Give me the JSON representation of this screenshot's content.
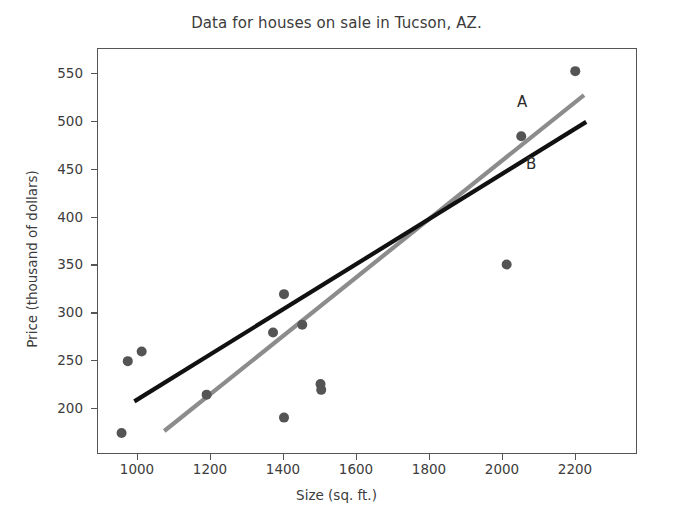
{
  "chart_data": {
    "type": "scatter",
    "title": "Data for houses on sale in Tucson, AZ.",
    "xlabel": "Size (sq. ft.)",
    "ylabel": "Price (thousand of dollars)",
    "xlim": [
      890,
      2270
    ],
    "ylim": [
      165,
      575
    ],
    "xticks": [
      1000,
      1200,
      1400,
      1600,
      1800,
      2000,
      2200
    ],
    "yticks": [
      200,
      250,
      300,
      350,
      400,
      450,
      500,
      550
    ],
    "xtick_labels": [
      "1000",
      "1200",
      "1400",
      "1600",
      "1800",
      "2000",
      "2200"
    ],
    "ytick_labels": [
      "200",
      "250",
      "300",
      "350",
      "400",
      "450",
      "500",
      "550"
    ],
    "grid": false,
    "legend": "none",
    "point_color": "#545454",
    "points": [
      {
        "x": 955,
        "y": 175
      },
      {
        "x": 972,
        "y": 250
      },
      {
        "x": 1010,
        "y": 260
      },
      {
        "x": 1188,
        "y": 215
      },
      {
        "x": 1370,
        "y": 280
      },
      {
        "x": 1400,
        "y": 320
      },
      {
        "x": 1400,
        "y": 191
      },
      {
        "x": 1450,
        "y": 288
      },
      {
        "x": 1500,
        "y": 226
      },
      {
        "x": 1502,
        "y": 220
      },
      {
        "x": 2010,
        "y": 351
      },
      {
        "x": 2050,
        "y": 485
      },
      {
        "x": 2198,
        "y": 553
      }
    ],
    "series": [
      {
        "name": "A",
        "type": "line",
        "color": "#8c8c8c",
        "label": "A",
        "label_x": 2055,
        "label_y": 520,
        "x": [
          1072,
          2222
        ],
        "y": [
          177,
          528
        ]
      },
      {
        "name": "B",
        "type": "line",
        "color": "#111111",
        "label": "B",
        "label_x": 2080,
        "label_y": 455,
        "x": [
          990,
          2228
        ],
        "y": [
          208,
          500
        ]
      }
    ]
  }
}
